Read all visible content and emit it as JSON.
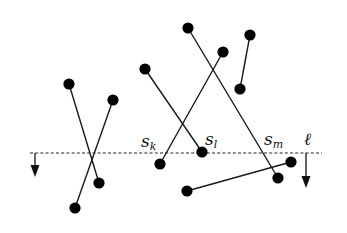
{
  "diagram": {
    "sweep_line": {
      "label": "ℓ",
      "y": 153,
      "x_start": 30,
      "x_end": 322,
      "style": "dashed",
      "direction": "down"
    },
    "arrows": [
      {
        "name": "left-arrow",
        "x": 35,
        "y1": 153,
        "y2": 177
      },
      {
        "name": "right-arrow",
        "x": 306,
        "y1": 153,
        "y2": 188
      }
    ],
    "segments": [
      {
        "id": "seg-1",
        "p1": [
          69,
          84
        ],
        "p2": [
          99,
          183
        ]
      },
      {
        "id": "seg-2",
        "p1": [
          113,
          100
        ],
        "p2": [
          75,
          208
        ]
      },
      {
        "id": "s_l",
        "p1": [
          145,
          69
        ],
        "p2": [
          202,
          152
        ]
      },
      {
        "id": "s_k",
        "p1": [
          223,
          52
        ],
        "p2": [
          160,
          164
        ]
      },
      {
        "id": "s_m",
        "p1": [
          188,
          28
        ],
        "p2": [
          278,
          178
        ]
      },
      {
        "id": "seg-6",
        "p1": [
          250,
          35
        ],
        "p2": [
          240,
          89
        ]
      },
      {
        "id": "seg-7",
        "p1": [
          187,
          191
        ],
        "p2": [
          291,
          162
        ]
      }
    ],
    "labels": [
      {
        "id": "label-sk",
        "base": "s",
        "sub": "k",
        "x": 141,
        "y": 147
      },
      {
        "id": "label-sl",
        "base": "s",
        "sub": "l",
        "x": 205,
        "y": 145
      },
      {
        "id": "label-sm",
        "base": "s",
        "sub": "m",
        "x": 264,
        "y": 145
      },
      {
        "id": "label-ell",
        "base": "ℓ",
        "sub": "",
        "x": 304,
        "y": 145
      }
    ],
    "colors": {
      "background": "#ffffff",
      "ink": "#111111"
    }
  }
}
